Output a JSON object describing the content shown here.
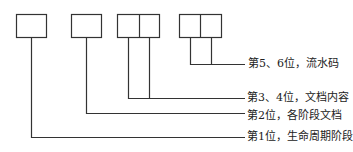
{
  "diagram": {
    "type": "document-code-structure",
    "boxes": [
      {
        "id": "digit-1",
        "cells": 1
      },
      {
        "id": "digit-2",
        "cells": 1
      },
      {
        "id": "digits-3-4",
        "cells": 2
      },
      {
        "id": "digits-5-6",
        "cells": 2
      }
    ],
    "labels": {
      "serial": "第5、6位，流水码",
      "content": "第3、4位，文档内容",
      "stage_doc": "第2位，各阶段文档",
      "lifecycle": "第1位，生命周期阶段"
    },
    "colors": {
      "line": "#333333",
      "text": "#222222",
      "background": "#ffffff"
    }
  }
}
